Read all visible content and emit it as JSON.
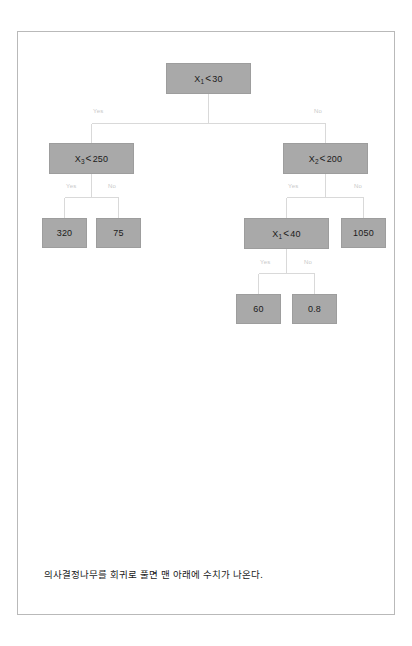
{
  "page": {
    "background_color": "#ffffff",
    "border_color": "#b9b9b9"
  },
  "diagram": {
    "type": "decision-tree",
    "node_fill_color": "#a9a9a9",
    "edge_color": "#d6d6d6",
    "edge_label_color": "#c8c8c8",
    "nodes": [
      {
        "id": "root",
        "kind": "decision",
        "variable": "X",
        "subscript": "1",
        "operator": "<",
        "threshold": "30",
        "text": "X1 < 30"
      },
      {
        "id": "n_l",
        "kind": "decision",
        "variable": "X",
        "subscript": "3",
        "operator": "<",
        "threshold": "250",
        "text": "X3 < 250"
      },
      {
        "id": "n_r",
        "kind": "decision",
        "variable": "X",
        "subscript": "2",
        "operator": "<",
        "threshold": "200",
        "text": "X2 < 200"
      },
      {
        "id": "leaf_320",
        "kind": "leaf",
        "value": "320"
      },
      {
        "id": "leaf_75",
        "kind": "leaf",
        "value": "75"
      },
      {
        "id": "n_rl",
        "kind": "decision",
        "variable": "X",
        "subscript": "1",
        "operator": "<",
        "threshold": "40",
        "text": "X1 < 40"
      },
      {
        "id": "leaf_1050",
        "kind": "leaf",
        "value": "1050"
      },
      {
        "id": "leaf_60",
        "kind": "leaf",
        "value": "60"
      },
      {
        "id": "leaf_08",
        "kind": "leaf",
        "value": "0.8"
      }
    ],
    "edge_labels": {
      "yes": "Yes",
      "no": "No"
    }
  },
  "caption": {
    "text": "의사결정나무를 회귀로 풀면 맨 아래에 수치가 나온다."
  }
}
